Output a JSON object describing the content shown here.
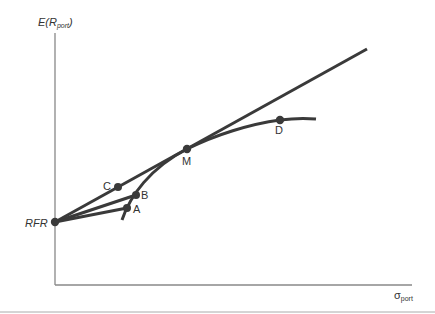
{
  "diagram": {
    "y_axis_label": {
      "main": "E(R",
      "sub": "port",
      "close": ")"
    },
    "x_axis_label": {
      "main": "σ",
      "sub": "port"
    },
    "points": {
      "rfr": {
        "label": "RFR"
      },
      "a": {
        "label": "A"
      },
      "b": {
        "label": "B"
      },
      "c": {
        "label": "C"
      },
      "m": {
        "label": "M"
      },
      "d": {
        "label": "D"
      }
    },
    "colors": {
      "line": "#3a3a3a",
      "axis": "#888888"
    }
  }
}
